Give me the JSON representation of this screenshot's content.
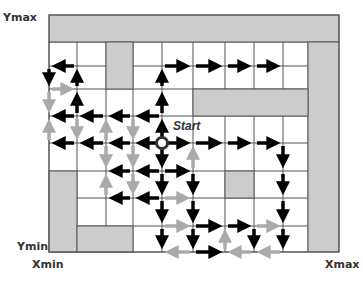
{
  "labels": {
    "ymax": "Ymax",
    "ymin": "Ymin",
    "xmin": "Xmin",
    "xmax": "Xmax",
    "start": "Start"
  },
  "colors": {
    "obstacle": "#cccccc",
    "grid_line": "#555555",
    "black_arrow": "#000000",
    "gray_arrow": "#aaaaaa",
    "start_ring": "#333333"
  },
  "grid": {
    "cols": [
      49,
      77,
      106,
      133,
      162,
      193,
      225,
      254,
      283,
      308
    ],
    "rows": [
      42,
      66,
      89,
      116,
      143,
      171,
      198,
      226,
      252
    ],
    "outer": {
      "x": 49,
      "y": 15,
      "w": 290,
      "h": 237
    }
  },
  "obstacles": [
    {
      "name": "top-band",
      "x": 49,
      "y": 15,
      "w": 290,
      "h": 27
    },
    {
      "name": "right-column",
      "x": 308,
      "y": 42,
      "w": 31,
      "h": 210
    },
    {
      "name": "upper-pillar",
      "x": 106,
      "y": 42,
      "w": 27,
      "h": 47
    },
    {
      "name": "middle-band",
      "x": 193,
      "y": 89,
      "w": 115,
      "h": 27
    },
    {
      "name": "lower-left-column",
      "x": 49,
      "y": 171,
      "w": 28,
      "h": 81
    },
    {
      "name": "bottom-block",
      "x": 77,
      "y": 226,
      "w": 56,
      "h": 26
    },
    {
      "name": "center-square",
      "x": 225,
      "y": 171,
      "w": 29,
      "h": 27
    }
  ],
  "start": {
    "col": 4,
    "row": 4
  },
  "arrows": [
    {
      "from": [
        1,
        1
      ],
      "to": [
        0,
        1
      ],
      "c": "b"
    },
    {
      "from": [
        0,
        1
      ],
      "to": [
        0,
        2
      ],
      "c": "b"
    },
    {
      "from": [
        0,
        2
      ],
      "to": [
        1,
        2
      ],
      "c": "g"
    },
    {
      "from": [
        1,
        2
      ],
      "to": [
        1,
        1
      ],
      "c": "b"
    },
    {
      "from": [
        1,
        3
      ],
      "to": [
        1,
        2
      ],
      "c": "b"
    },
    {
      "from": [
        1,
        3
      ],
      "to": [
        0,
        3
      ],
      "c": "b"
    },
    {
      "from": [
        2,
        3
      ],
      "to": [
        1,
        3
      ],
      "c": "b"
    },
    {
      "from": [
        3,
        3
      ],
      "to": [
        2,
        3
      ],
      "c": "b"
    },
    {
      "from": [
        4,
        3
      ],
      "to": [
        3,
        3
      ],
      "c": "b"
    },
    {
      "from": [
        0,
        2
      ],
      "to": [
        0,
        3
      ],
      "c": "g"
    },
    {
      "from": [
        0,
        4
      ],
      "to": [
        0,
        3
      ],
      "c": "g"
    },
    {
      "from": [
        1,
        3
      ],
      "to": [
        1,
        4
      ],
      "c": "g"
    },
    {
      "from": [
        2,
        4
      ],
      "to": [
        2,
        3
      ],
      "c": "g"
    },
    {
      "from": [
        3,
        3
      ],
      "to": [
        3,
        4
      ],
      "c": "g"
    },
    {
      "from": [
        4,
        4
      ],
      "to": [
        4,
        3
      ],
      "c": "b"
    },
    {
      "from": [
        4,
        3
      ],
      "to": [
        4,
        2
      ],
      "c": "b"
    },
    {
      "from": [
        4,
        2
      ],
      "to": [
        4,
        1
      ],
      "c": "b"
    },
    {
      "from": [
        4,
        1
      ],
      "to": [
        5,
        1
      ],
      "c": "b"
    },
    {
      "from": [
        5,
        1
      ],
      "to": [
        6,
        1
      ],
      "c": "b"
    },
    {
      "from": [
        6,
        1
      ],
      "to": [
        7,
        1
      ],
      "c": "b"
    },
    {
      "from": [
        7,
        1
      ],
      "to": [
        8,
        1
      ],
      "c": "b"
    },
    {
      "from": [
        4,
        4
      ],
      "to": [
        3,
        4
      ],
      "c": "b"
    },
    {
      "from": [
        3,
        4
      ],
      "to": [
        2,
        4
      ],
      "c": "b"
    },
    {
      "from": [
        2,
        4
      ],
      "to": [
        1,
        4
      ],
      "c": "b"
    },
    {
      "from": [
        1,
        4
      ],
      "to": [
        0,
        4
      ],
      "c": "b"
    },
    {
      "from": [
        4,
        4
      ],
      "to": [
        5,
        4
      ],
      "c": "b"
    },
    {
      "from": [
        5,
        4
      ],
      "to": [
        6,
        4
      ],
      "c": "b"
    },
    {
      "from": [
        6,
        4
      ],
      "to": [
        7,
        4
      ],
      "c": "b"
    },
    {
      "from": [
        7,
        4
      ],
      "to": [
        8,
        4
      ],
      "c": "b"
    },
    {
      "from": [
        8,
        4
      ],
      "to": [
        8,
        5
      ],
      "c": "b"
    },
    {
      "from": [
        8,
        5
      ],
      "to": [
        8,
        6
      ],
      "c": "b"
    },
    {
      "from": [
        8,
        6
      ],
      "to": [
        8,
        7
      ],
      "c": "b"
    },
    {
      "from": [
        8,
        7
      ],
      "to": [
        8,
        8
      ],
      "c": "b"
    },
    {
      "from": [
        3,
        4
      ],
      "to": [
        3,
        5
      ],
      "c": "g"
    },
    {
      "from": [
        3,
        5
      ],
      "to": [
        3,
        6
      ],
      "c": "g"
    },
    {
      "from": [
        2,
        6
      ],
      "to": [
        2,
        5
      ],
      "c": "g"
    },
    {
      "from": [
        2,
        4
      ],
      "to": [
        2,
        5
      ],
      "c": "g"
    },
    {
      "from": [
        4,
        5
      ],
      "to": [
        3,
        5
      ],
      "c": "b"
    },
    {
      "from": [
        3,
        5
      ],
      "to": [
        2,
        5
      ],
      "c": "b"
    },
    {
      "from": [
        4,
        5
      ],
      "to": [
        5,
        5
      ],
      "c": "b"
    },
    {
      "from": [
        4,
        6
      ],
      "to": [
        3,
        6
      ],
      "c": "b"
    },
    {
      "from": [
        3,
        6
      ],
      "to": [
        2,
        6
      ],
      "c": "b"
    },
    {
      "from": [
        4,
        6
      ],
      "to": [
        5,
        6
      ],
      "c": "g"
    },
    {
      "from": [
        4,
        4
      ],
      "to": [
        4,
        5
      ],
      "c": "b"
    },
    {
      "from": [
        4,
        5
      ],
      "to": [
        4,
        6
      ],
      "c": "b"
    },
    {
      "from": [
        4,
        6
      ],
      "to": [
        4,
        7
      ],
      "c": "b"
    },
    {
      "from": [
        4,
        7
      ],
      "to": [
        4,
        8
      ],
      "c": "b"
    },
    {
      "from": [
        5,
        5
      ],
      "to": [
        5,
        4
      ],
      "c": "g"
    },
    {
      "from": [
        5,
        5
      ],
      "to": [
        5,
        6
      ],
      "c": "b"
    },
    {
      "from": [
        5,
        6
      ],
      "to": [
        5,
        7
      ],
      "c": "b"
    },
    {
      "from": [
        5,
        7
      ],
      "to": [
        5,
        8
      ],
      "c": "b"
    },
    {
      "from": [
        4,
        7
      ],
      "to": [
        5,
        7
      ],
      "c": "g"
    },
    {
      "from": [
        5,
        7
      ],
      "to": [
        6,
        7
      ],
      "c": "b"
    },
    {
      "from": [
        6,
        7
      ],
      "to": [
        7,
        7
      ],
      "c": "b"
    },
    {
      "from": [
        7,
        7
      ],
      "to": [
        8,
        7
      ],
      "c": "g"
    },
    {
      "from": [
        7,
        7
      ],
      "to": [
        7,
        8
      ],
      "c": "b"
    },
    {
      "from": [
        6,
        8
      ],
      "to": [
        6,
        7
      ],
      "c": "g"
    },
    {
      "from": [
        5,
        8
      ],
      "to": [
        4,
        8
      ],
      "c": "g"
    },
    {
      "from": [
        5,
        8
      ],
      "to": [
        6,
        8
      ],
      "c": "b"
    },
    {
      "from": [
        7,
        8
      ],
      "to": [
        6,
        8
      ],
      "c": "g"
    },
    {
      "from": [
        8,
        8
      ],
      "to": [
        7,
        8
      ],
      "c": "g"
    }
  ]
}
